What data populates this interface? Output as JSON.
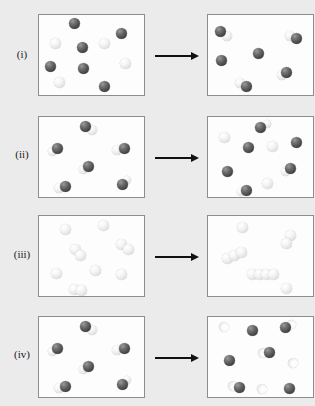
{
  "figure": {
    "background_color": "#ebebeb",
    "panel_background": "#fdfdfd",
    "panel_border_color": "#8d8d8d",
    "arrow_color": "#111111",
    "dark_sphere_color": "#4c4c4c",
    "light_sphere_color": "#eeeeee",
    "rows": [
      {
        "label": "(i)",
        "label_y": 55,
        "panel_top": 14,
        "panel_width": 107,
        "panel_height": 82,
        "arrow": {
          "left": 155,
          "top": 50,
          "length": 44
        },
        "before": {
          "caption": "before",
          "dark_count": 6,
          "light_count": 4,
          "spheres": [
            {
              "type": "dark",
              "x": 69,
              "y": 18,
              "d": 11
            },
            {
              "type": "dark",
              "x": 116,
              "y": 28,
              "d": 11
            },
            {
              "type": "light",
              "x": 50,
              "y": 38,
              "d": 11
            },
            {
              "type": "dark",
              "x": 77,
              "y": 42,
              "d": 11
            },
            {
              "type": "light",
              "x": 99,
              "y": 38,
              "d": 11
            },
            {
              "type": "dark",
              "x": 45,
              "y": 61,
              "d": 11
            },
            {
              "type": "dark",
              "x": 78,
              "y": 63,
              "d": 11
            },
            {
              "type": "light",
              "x": 120,
              "y": 58,
              "d": 11
            },
            {
              "type": "light",
              "x": 54,
              "y": 77,
              "d": 11
            },
            {
              "type": "dark",
              "x": 99,
              "y": 81,
              "d": 11
            }
          ]
        },
        "after": {
          "caption": "after",
          "molecule_count": 4,
          "free_dark_count": 2,
          "spheres": [
            {
              "type": "dark",
              "x": 215,
              "y": 26,
              "d": 11
            },
            {
              "type": "light",
              "x": 222,
              "y": 31,
              "d": 10
            },
            {
              "type": "light",
              "x": 285,
              "y": 31,
              "d": 10
            },
            {
              "type": "dark",
              "x": 291,
              "y": 33,
              "d": 11
            },
            {
              "type": "dark",
              "x": 253,
              "y": 48,
              "d": 11
            },
            {
              "type": "dark",
              "x": 216,
              "y": 55,
              "d": 11
            },
            {
              "type": "light",
              "x": 277,
              "y": 70,
              "d": 10
            },
            {
              "type": "dark",
              "x": 281,
              "y": 67,
              "d": 11
            },
            {
              "type": "light",
              "x": 235,
              "y": 78,
              "d": 10
            },
            {
              "type": "dark",
              "x": 241,
              "y": 81,
              "d": 11
            }
          ]
        }
      },
      {
        "label": "(ii)",
        "label_y": 155,
        "panel_top": 116,
        "panel_width": 107,
        "panel_height": 82,
        "arrow": {
          "left": 155,
          "top": 152,
          "length": 44
        },
        "before": {
          "caption": "before",
          "molecule_count": 6,
          "spheres": [
            {
              "type": "dark",
              "x": 80,
              "y": 121,
              "d": 11
            },
            {
              "type": "light",
              "x": 87,
              "y": 125,
              "d": 10
            },
            {
              "type": "dark",
              "x": 52,
              "y": 143,
              "d": 11
            },
            {
              "type": "light",
              "x": 48,
              "y": 147,
              "d": 9
            },
            {
              "type": "light",
              "x": 112,
              "y": 145,
              "d": 10
            },
            {
              "type": "dark",
              "x": 119,
              "y": 143,
              "d": 11
            },
            {
              "type": "dark",
              "x": 83,
              "y": 161,
              "d": 11
            },
            {
              "type": "light",
              "x": 79,
              "y": 165,
              "d": 9
            },
            {
              "type": "light",
              "x": 54,
              "y": 183,
              "d": 10
            },
            {
              "type": "dark",
              "x": 60,
              "y": 181,
              "d": 11
            },
            {
              "type": "dark",
              "x": 117,
              "y": 179,
              "d": 11
            },
            {
              "type": "light",
              "x": 123,
              "y": 176,
              "d": 8
            }
          ]
        },
        "after": {
          "caption": "after",
          "dark_count": 6,
          "light_count": 6,
          "spheres": [
            {
              "type": "dark",
              "x": 255,
              "y": 122,
              "d": 11
            },
            {
              "type": "light",
              "x": 263,
              "y": 120,
              "d": 8
            },
            {
              "type": "light",
              "x": 219,
              "y": 132,
              "d": 11
            },
            {
              "type": "dark",
              "x": 243,
              "y": 142,
              "d": 11
            },
            {
              "type": "light",
              "x": 267,
              "y": 141,
              "d": 11
            },
            {
              "type": "dark",
              "x": 291,
              "y": 137,
              "d": 11
            },
            {
              "type": "dark",
              "x": 222,
              "y": 166,
              "d": 11
            },
            {
              "type": "dark",
              "x": 285,
              "y": 163,
              "d": 11
            },
            {
              "type": "light",
              "x": 281,
              "y": 167,
              "d": 9
            },
            {
              "type": "light",
              "x": 262,
              "y": 178,
              "d": 11
            },
            {
              "type": "dark",
              "x": 241,
              "y": 185,
              "d": 11
            },
            {
              "type": "light",
              "x": 237,
              "y": 188,
              "d": 8
            }
          ]
        }
      },
      {
        "label": "(iii)",
        "label_y": 255,
        "panel_top": 215,
        "panel_width": 107,
        "panel_height": 82,
        "arrow": {
          "left": 155,
          "top": 251,
          "length": 44
        },
        "before": {
          "caption": "before",
          "light_count": 10,
          "spheres": [
            {
              "type": "light",
              "x": 60,
              "y": 224,
              "d": 11
            },
            {
              "type": "light",
              "x": 98,
              "y": 220,
              "d": 11
            },
            {
              "type": "light",
              "x": 116,
              "y": 239,
              "d": 11
            },
            {
              "type": "light",
              "x": 123,
              "y": 244,
              "d": 11
            },
            {
              "type": "light",
              "x": 70,
              "y": 244,
              "d": 11
            },
            {
              "type": "light",
              "x": 75,
              "y": 250,
              "d": 11
            },
            {
              "type": "light",
              "x": 51,
              "y": 268,
              "d": 11
            },
            {
              "type": "light",
              "x": 90,
              "y": 265,
              "d": 11
            },
            {
              "type": "light",
              "x": 116,
              "y": 269,
              "d": 11
            },
            {
              "type": "light",
              "x": 69,
              "y": 284,
              "d": 11
            },
            {
              "type": "light",
              "x": 76,
              "y": 285,
              "d": 11
            }
          ]
        },
        "after": {
          "caption": "after",
          "chains": [
            3,
            4,
            2
          ],
          "single_count": 2,
          "spheres": [
            {
              "type": "light",
              "x": 237,
              "y": 222,
              "d": 11
            },
            {
              "type": "light",
              "x": 285,
              "y": 230,
              "d": 11
            },
            {
              "type": "light",
              "x": 281,
              "y": 238,
              "d": 11
            },
            {
              "type": "light",
              "x": 222,
              "y": 253,
              "d": 11
            },
            {
              "type": "light",
              "x": 229,
              "y": 250,
              "d": 11
            },
            {
              "type": "light",
              "x": 236,
              "y": 247,
              "d": 11
            },
            {
              "type": "light",
              "x": 247,
              "y": 269,
              "d": 11
            },
            {
              "type": "light",
              "x": 254,
              "y": 269,
              "d": 11
            },
            {
              "type": "light",
              "x": 261,
              "y": 269,
              "d": 11
            },
            {
              "type": "light",
              "x": 268,
              "y": 269,
              "d": 11
            },
            {
              "type": "light",
              "x": 281,
              "y": 283,
              "d": 11
            }
          ]
        }
      },
      {
        "label": "(iv)",
        "label_y": 355,
        "panel_top": 316,
        "panel_width": 107,
        "panel_height": 82,
        "arrow": {
          "left": 155,
          "top": 352,
          "length": 44
        },
        "before": {
          "caption": "before",
          "molecule_count": 6,
          "spheres": [
            {
              "type": "dark",
              "x": 80,
              "y": 321,
              "d": 11
            },
            {
              "type": "light",
              "x": 87,
              "y": 325,
              "d": 10
            },
            {
              "type": "dark",
              "x": 52,
              "y": 343,
              "d": 11
            },
            {
              "type": "light",
              "x": 48,
              "y": 347,
              "d": 9
            },
            {
              "type": "light",
              "x": 112,
              "y": 345,
              "d": 10
            },
            {
              "type": "dark",
              "x": 119,
              "y": 343,
              "d": 11
            },
            {
              "type": "dark",
              "x": 83,
              "y": 361,
              "d": 11
            },
            {
              "type": "light",
              "x": 79,
              "y": 365,
              "d": 9
            },
            {
              "type": "light",
              "x": 54,
              "y": 383,
              "d": 10
            },
            {
              "type": "dark",
              "x": 60,
              "y": 381,
              "d": 11
            },
            {
              "type": "dark",
              "x": 117,
              "y": 379,
              "d": 11
            },
            {
              "type": "light",
              "x": 123,
              "y": 376,
              "d": 8
            }
          ]
        },
        "after": {
          "caption": "after",
          "dark_count": 6,
          "light_partial_count": 6,
          "spheres": [
            {
              "type": "crescent",
              "x": 219,
              "y": 322,
              "d": 10
            },
            {
              "type": "dark",
              "x": 247,
              "y": 325,
              "d": 11
            },
            {
              "type": "dark",
              "x": 280,
              "y": 322,
              "d": 11
            },
            {
              "type": "crescent",
              "x": 287,
              "y": 320,
              "d": 9
            },
            {
              "type": "crescent",
              "x": 258,
              "y": 348,
              "d": 10
            },
            {
              "type": "dark",
              "x": 264,
              "y": 347,
              "d": 11
            },
            {
              "type": "dark",
              "x": 224,
              "y": 355,
              "d": 11
            },
            {
              "type": "crescent",
              "x": 288,
              "y": 358,
              "d": 10
            },
            {
              "type": "crescent",
              "x": 228,
              "y": 381,
              "d": 10
            },
            {
              "type": "dark",
              "x": 234,
              "y": 382,
              "d": 11
            },
            {
              "type": "crescent",
              "x": 257,
              "y": 384,
              "d": 10
            },
            {
              "type": "dark",
              "x": 284,
              "y": 383,
              "d": 11
            }
          ]
        }
      }
    ]
  }
}
